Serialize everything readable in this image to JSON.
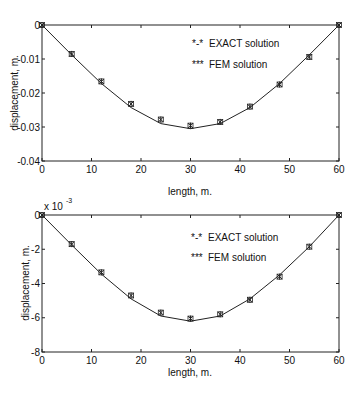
{
  "chart_data": [
    {
      "type": "line",
      "title": "",
      "xlabel": "length, m.",
      "ylabel": "displacement, m.",
      "xlim": [
        0,
        60
      ],
      "ylim": [
        -0.04,
        0
      ],
      "x_ticks": [
        0,
        10,
        20,
        30,
        40,
        50,
        60
      ],
      "x_tick_labels": [
        "0",
        "10",
        "20",
        "30",
        "40",
        "50",
        "60"
      ],
      "y_ticks": [
        0,
        -0.01,
        -0.02,
        -0.03,
        -0.04
      ],
      "y_tick_labels": [
        "0",
        "-0.01",
        "-0.02",
        "-0.03",
        "-0.04"
      ],
      "grid": false,
      "legend": [
        "*-* EXACT solution",
        "*** FEM solution"
      ],
      "legend_position": "upper center",
      "series": [
        {
          "name": "EXACT solution",
          "style": "line",
          "x": [
            0,
            6,
            12,
            18,
            24,
            30,
            36,
            42,
            48,
            54,
            60
          ],
          "values": [
            0,
            -0.0088,
            -0.0172,
            -0.0243,
            -0.029,
            -0.0305,
            -0.029,
            -0.0243,
            -0.0172,
            -0.0088,
            0
          ]
        },
        {
          "name": "FEM solution",
          "style": "markers",
          "x": [
            0,
            6,
            12,
            18,
            24,
            30,
            36,
            42,
            48,
            54,
            60
          ],
          "values": [
            0,
            -0.0085,
            -0.0166,
            -0.0232,
            -0.0278,
            -0.0296,
            -0.0285,
            -0.024,
            -0.0175,
            -0.0094,
            0
          ]
        }
      ]
    },
    {
      "type": "line",
      "title": "",
      "xlabel": "length, m.",
      "ylabel": "displacement, m.",
      "y_scale_note": "x 10^-3",
      "xlim": [
        0,
        60
      ],
      "ylim": [
        -8,
        0
      ],
      "x_ticks": [
        0,
        10,
        20,
        30,
        40,
        50,
        60
      ],
      "x_tick_labels": [
        "0",
        "10",
        "20",
        "30",
        "40",
        "50",
        "60"
      ],
      "y_ticks": [
        0,
        -2,
        -4,
        -6,
        -8
      ],
      "y_tick_labels": [
        "0",
        "-2",
        "-4",
        "-6",
        "-8"
      ],
      "grid": false,
      "legend": [
        "*-* EXACT solution",
        "*** FEM solution"
      ],
      "legend_position": "upper center",
      "series": [
        {
          "name": "EXACT solution",
          "style": "line",
          "x": [
            0,
            6,
            12,
            18,
            24,
            30,
            36,
            42,
            48,
            54,
            60
          ],
          "values": [
            0,
            -1.75,
            -3.45,
            -4.9,
            -5.9,
            -6.2,
            -5.9,
            -4.9,
            -3.5,
            -1.85,
            0
          ]
        },
        {
          "name": "FEM solution",
          "style": "markers",
          "x": [
            0,
            6,
            12,
            18,
            24,
            30,
            36,
            42,
            48,
            54,
            60
          ],
          "values": [
            0,
            -1.7,
            -3.35,
            -4.7,
            -5.7,
            -6.05,
            -5.8,
            -4.95,
            -3.6,
            -1.85,
            0
          ]
        }
      ]
    }
  ],
  "labels": {
    "top": {
      "ylabel": "displacement, m.",
      "xlabel": "length, m.",
      "legend_exact_marker": "*-*",
      "legend_exact": "EXACT solution",
      "legend_fem_marker": "***",
      "legend_fem": "FEM solution"
    },
    "bottom": {
      "ylabel": "displacement, m.",
      "xlabel": "length, m.",
      "scale_prefix": "x 10",
      "scale_exp": "-3",
      "legend_exact_marker": "*-*",
      "legend_exact": "EXACT solution",
      "legend_fem_marker": "***",
      "legend_fem": "FEM solution"
    }
  },
  "colors": {
    "line": "#222222",
    "axis": "#222222",
    "background": "#ffffff"
  }
}
